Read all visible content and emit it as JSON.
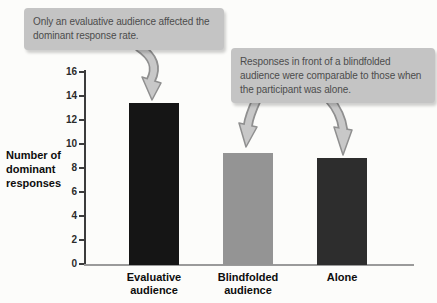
{
  "annotations": {
    "callout_evaluative": {
      "text": "Only an evaluative audience affected the dominant response rate."
    },
    "callout_blindfolded_alone": {
      "text": "Responses in front of a blindfolded audience were comparable to those when the participant was alone."
    },
    "box_color": "#c4c4c4",
    "text_color": "#4c4c4c",
    "arrow_fill": "#c8c8c8",
    "arrow_outline": "#8f8f8f"
  },
  "chart_data": {
    "type": "bar",
    "title": "",
    "xlabel": "",
    "ylabel": "Number of dominant responses",
    "categories": [
      "Evaluative audience",
      "Blindfolded audience",
      "Alone"
    ],
    "values": [
      13.5,
      9.3,
      8.9
    ],
    "bar_colors": [
      "#151515",
      "#949494",
      "#2d2d2d"
    ],
    "ylim": [
      0,
      16
    ],
    "yticks": [
      0,
      2,
      4,
      6,
      8,
      10,
      12,
      14,
      16
    ],
    "grid": false,
    "legend": "none"
  }
}
